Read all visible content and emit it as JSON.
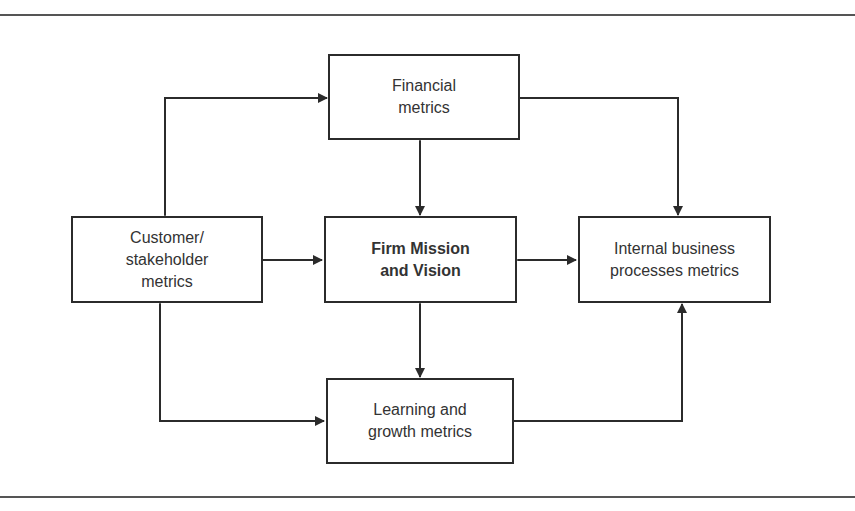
{
  "diagram": {
    "nodes": {
      "financial": {
        "label": "Financial\nmetrics"
      },
      "customer": {
        "label": "Customer/\nstakeholder\nmetrics"
      },
      "center": {
        "label": "Firm Mission\nand Vision"
      },
      "internal": {
        "label": "Internal business\nprocesses metrics"
      },
      "learning": {
        "label": "Learning and\ngrowth metrics"
      }
    },
    "edges": [
      {
        "from": "customer",
        "to": "financial",
        "type": "bidirectional",
        "route": "elbow"
      },
      {
        "from": "financial",
        "to": "internal",
        "type": "bidirectional",
        "route": "elbow"
      },
      {
        "from": "financial",
        "to": "center",
        "type": "bidirectional"
      },
      {
        "from": "customer",
        "to": "center",
        "type": "bidirectional"
      },
      {
        "from": "center",
        "to": "internal",
        "type": "bidirectional"
      },
      {
        "from": "center",
        "to": "learning",
        "type": "bidirectional"
      },
      {
        "from": "customer",
        "to": "learning",
        "type": "bidirectional",
        "route": "elbow"
      },
      {
        "from": "internal",
        "to": "learning",
        "type": "bidirectional",
        "route": "elbow"
      }
    ],
    "colors": {
      "line": "#2b2b2b",
      "rule": "#555555",
      "background": "#ffffff"
    }
  }
}
